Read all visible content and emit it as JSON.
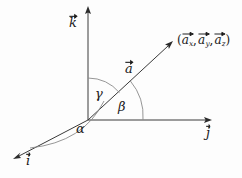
{
  "figure": {
    "background_color": "#fdfdfd",
    "line_color": "#3a3a3a",
    "arc_color": "#8a8a8a",
    "text_color": "#1a1a1a"
  },
  "axes": [
    {
      "id": "k-axis",
      "label_letter": "k",
      "label_text": "k⃗",
      "description": "vertical z-axis unit vector pointing up",
      "direction": "up"
    },
    {
      "id": "j-axis",
      "label_letter": "j",
      "label_text": "j⃗",
      "description": "horizontal y-axis unit vector pointing right",
      "direction": "right"
    },
    {
      "id": "i-axis",
      "label_letter": "i",
      "label_text": "i⃗",
      "description": "oblique x-axis unit vector pointing down-left toward viewer",
      "direction": "down-left"
    }
  ],
  "vector": {
    "id": "vector-a",
    "label_letter": "a",
    "label_text": "a⃗",
    "endpoint_label": {
      "open_paren": "(",
      "close_paren": ")",
      "separator": ",",
      "components": [
        {
          "base": "a",
          "subscript": "x",
          "text": "a⃗ₓ"
        },
        {
          "base": "a",
          "subscript": "y",
          "text": "a⃗ᵧ"
        },
        {
          "base": "a",
          "subscript": "z",
          "text": "a⃗_z"
        }
      ]
    }
  },
  "angles": [
    {
      "id": "angle-alpha",
      "symbol": "α",
      "name": "alpha",
      "between": "i-axis and vector a"
    },
    {
      "id": "angle-beta",
      "symbol": "β",
      "name": "beta",
      "between": "j-axis and vector a"
    },
    {
      "id": "angle-gamma",
      "symbol": "γ",
      "name": "gamma",
      "between": "k-axis and vector a"
    }
  ]
}
